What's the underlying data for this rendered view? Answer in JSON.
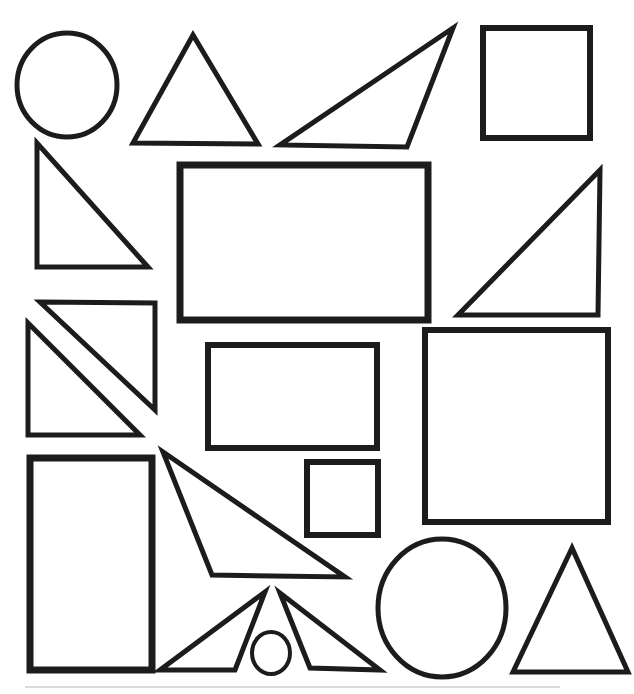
{
  "canvas": {
    "width": 634,
    "height": 694,
    "background": "#ffffff",
    "stroke_color": "#1c1c1c",
    "shape_fill": "#ffffff"
  },
  "shapes": [
    {
      "type": "ellipse",
      "name": "circle-large-top-left",
      "cx": 67,
      "cy": 85,
      "rx": 50,
      "ry": 52,
      "stroke_width": 5
    },
    {
      "type": "polygon",
      "name": "triangle-acute-top",
      "points": "193,35 133,143 258,144",
      "stroke_width": 5
    },
    {
      "type": "polygon",
      "name": "triangle-scalene-top",
      "points": "453,28 280,145 407,147",
      "stroke_width": 5
    },
    {
      "type": "rect",
      "name": "square-top-right",
      "x": 483,
      "y": 28,
      "width": 107,
      "height": 110,
      "stroke_width": 6
    },
    {
      "type": "polygon",
      "name": "triangle-right-angle-left",
      "points": "37,143 37,267 148,267",
      "stroke_width": 5
    },
    {
      "type": "rect",
      "name": "rectangle-large-center",
      "x": 180,
      "y": 165,
      "width": 248,
      "height": 155,
      "stroke_width": 7
    },
    {
      "type": "polygon",
      "name": "triangle-right-angle-right",
      "points": "600,170 458,315 598,315",
      "stroke_width": 5
    },
    {
      "type": "polygon",
      "name": "triangle-split-square-upper",
      "points": "40,302 155,303 155,410",
      "stroke_width": 5
    },
    {
      "type": "polygon",
      "name": "triangle-split-square-lower",
      "points": "28,323 28,435 140,435",
      "stroke_width": 5
    },
    {
      "type": "rect",
      "name": "rectangle-medium-center",
      "x": 208,
      "y": 345,
      "width": 169,
      "height": 103,
      "stroke_width": 6
    },
    {
      "type": "rect",
      "name": "square-large-right",
      "x": 425,
      "y": 330,
      "width": 183,
      "height": 192,
      "stroke_width": 6
    },
    {
      "type": "rect",
      "name": "square-small-center",
      "x": 307,
      "y": 462,
      "width": 71,
      "height": 73,
      "stroke_width": 6
    },
    {
      "type": "rect",
      "name": "rectangle-tall-bottom-left",
      "x": 30,
      "y": 458,
      "width": 122,
      "height": 212,
      "stroke_width": 7
    },
    {
      "type": "polygon",
      "name": "triangle-scalene-middle",
      "points": "163,452 212,575 345,577",
      "stroke_width": 5
    },
    {
      "type": "polygon",
      "name": "triangle-small-bottom-left",
      "points": "265,592 160,670 235,670",
      "stroke_width": 5
    },
    {
      "type": "polygon",
      "name": "triangle-small-bottom-right",
      "points": "280,593 310,668 380,670",
      "stroke_width": 5
    },
    {
      "type": "ellipse",
      "name": "circle-small-bottom",
      "cx": 271,
      "cy": 653,
      "rx": 19,
      "ry": 21,
      "stroke_width": 4
    },
    {
      "type": "ellipse",
      "name": "circle-large-bottom",
      "cx": 442,
      "cy": 608,
      "rx": 64,
      "ry": 69,
      "stroke_width": 5
    },
    {
      "type": "polygon",
      "name": "triangle-isosceles-bottom-right",
      "points": "572,548 513,672 628,672",
      "stroke_width": 5
    },
    {
      "type": "line",
      "name": "scan-artifact-line",
      "x1": 25,
      "y1": 687,
      "x2": 560,
      "y2": 687,
      "stroke": "#dadada",
      "stroke_width": 2
    }
  ]
}
